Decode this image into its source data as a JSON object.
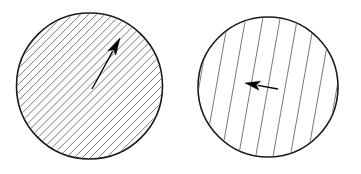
{
  "figure": {
    "type": "diagram",
    "title": "",
    "background_color": "#ffffff",
    "width": 361,
    "height": 174,
    "stroke_color": "#1a1a1a",
    "hatch_color": "#555555",
    "arrow_color": "#000000",
    "panel_count": 2
  },
  "panels": [
    {
      "id": "left-panel",
      "name": "left-circle-panel",
      "label": "",
      "circle": {
        "cx": 89.5,
        "cy": 86,
        "r": 73,
        "stroke_width": 1.6,
        "fill": "none"
      },
      "hatch": {
        "pattern": "diagonal",
        "angle_deg": 45,
        "direction": "bottom-left-to-top-right",
        "spacing_px": 5.7,
        "line_count": 36,
        "stroke_width": 0.8,
        "color": "#555555"
      },
      "arrow": {
        "name": "direction-arrow",
        "tail_x": 92,
        "tail_y": 89,
        "tip_x": 120,
        "tip_y": 38,
        "angle_deg": 61,
        "length_px": 58,
        "shaft_width": 1.3,
        "head_length": 17,
        "head_width": 9,
        "color": "#000000",
        "label": ""
      }
    },
    {
      "id": "right-panel",
      "name": "right-circle-panel",
      "label": "",
      "circle": {
        "cx": 268,
        "cy": 87,
        "r": 70,
        "stroke_width": 1.6,
        "fill": "none"
      },
      "hatch": {
        "pattern": "near-vertical",
        "angle_deg": 80,
        "direction": "bottom-left-to-top-right",
        "spacing_px": 17,
        "line_count": 9,
        "stroke_width": 0.8,
        "color": "#555555"
      },
      "arrow": {
        "name": "direction-arrow",
        "tail_x": 278,
        "tail_y": 89,
        "tip_x": 245,
        "tip_y": 83,
        "angle_deg": 190,
        "length_px": 34,
        "shaft_width": 1.3,
        "head_length": 15,
        "head_width": 9,
        "color": "#000000",
        "label": ""
      }
    }
  ]
}
